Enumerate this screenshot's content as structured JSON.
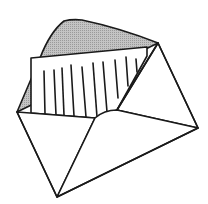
{
  "illustration": {
    "subject": "open-envelope-with-letter",
    "colors": {
      "background": "#ffffff",
      "outline": "#1a1a1a",
      "flap_fill": "#b8b8b8",
      "paper_fill": "#ffffff"
    },
    "letter_lines_count": 10
  }
}
